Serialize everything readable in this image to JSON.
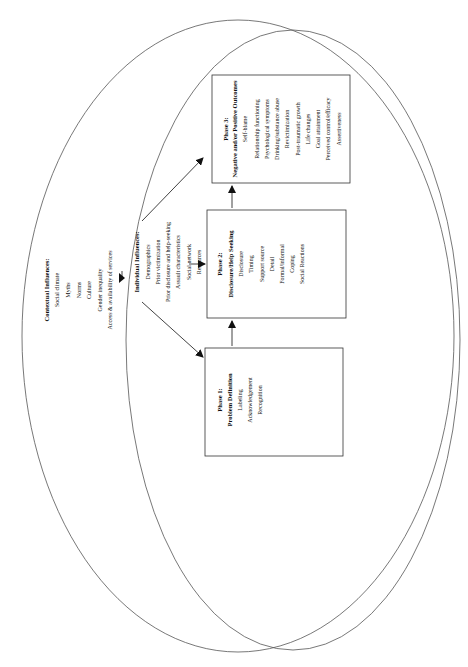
{
  "contextual": {
    "title": "Contextual Influences:",
    "items": [
      "Social climate",
      "Myths",
      "Norms",
      "Culture",
      "Gender inequality",
      "Access & availability of services"
    ]
  },
  "individual": {
    "title": "Individual Influences:",
    "items": [
      "Demographics",
      "Prior victimization",
      "Prior disclosure and help-seeking",
      "Assault characteristics",
      "Social network",
      "Resources"
    ]
  },
  "phase1": {
    "title": "Phase 1:",
    "subtitle": "Problem Definition",
    "items": [
      "Labeling",
      "Acknowledgement",
      "Recognition"
    ]
  },
  "phase2": {
    "title": "Phase 2:",
    "subtitle": "Disclosure/Help Seeking",
    "items": [
      "Disclosure",
      "Timing",
      "Support source",
      "Detail",
      "Formal/informal",
      "Coping",
      "Social Reactions"
    ]
  },
  "phase3": {
    "title": "Phase 3:",
    "subtitle": "Negative and/or Positive Outcomes",
    "items": [
      "Self-blame",
      "Relationship functioning",
      "Psychological symptoms",
      "Drinking/substance abuse",
      "Revictimization",
      "Post-traumatic growth",
      "Life changes",
      "Goal attainment",
      "Perceived control/efficacy",
      "Assertiveness"
    ]
  }
}
